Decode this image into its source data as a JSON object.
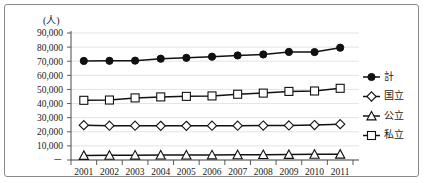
{
  "chart_data": {
    "type": "line",
    "title": "",
    "unit_label": "(人)",
    "xlabel": "",
    "ylabel": "",
    "grid": true,
    "legend_position": "right",
    "ylim": [
      0,
      90000
    ],
    "ytick_values": [
      0,
      10000,
      20000,
      30000,
      40000,
      50000,
      60000,
      70000,
      80000,
      90000
    ],
    "ytick_labels": [
      "－",
      "10,000",
      "20,000",
      "30,000",
      "40,000",
      "50,000",
      "60,000",
      "70,000",
      "80,000",
      "90,000"
    ],
    "categories": [
      "2001",
      "2002",
      "2003",
      "2004",
      "2005",
      "2006",
      "2007",
      "2008",
      "2009",
      "2010",
      "2011"
    ],
    "series": [
      {
        "name": "計",
        "marker": "filled-circle",
        "values": [
          70200,
          70300,
          70400,
          71800,
          72400,
          73200,
          74100,
          74800,
          76600,
          76500,
          79600
        ]
      },
      {
        "name": "国立",
        "marker": "hollow-diamond",
        "values": [
          24700,
          24300,
          24300,
          24200,
          24200,
          24300,
          24300,
          24400,
          24500,
          24800,
          25400
        ]
      },
      {
        "name": "公立",
        "marker": "hollow-triangle",
        "values": [
          3200,
          3300,
          3400,
          3500,
          3500,
          3600,
          3700,
          3800,
          3900,
          4000,
          4100
        ]
      },
      {
        "name": "私立",
        "marker": "hollow-square",
        "values": [
          42300,
          42500,
          44000,
          44700,
          45100,
          45400,
          46600,
          47400,
          48600,
          48900,
          50800
        ]
      }
    ]
  },
  "colors": {
    "line": "#111111",
    "grid": "#d9d9d9",
    "axis": "#4a4a4a",
    "text": "#1a1a1a",
    "frame": "#8a8a8a",
    "background": "#ffffff"
  }
}
